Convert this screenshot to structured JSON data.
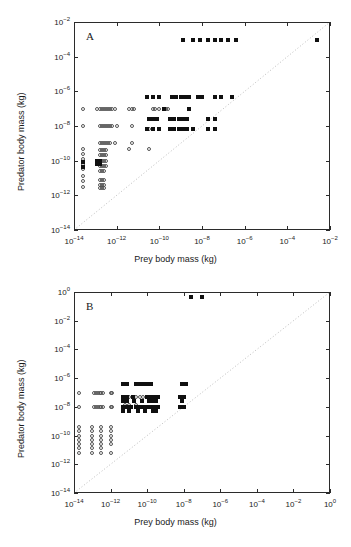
{
  "figure": {
    "axis_titles": {
      "x": "Prey body mass (kg)",
      "y": "Predator body mass (kg)"
    },
    "colors": {
      "axis": "#2b2b2b",
      "marker_filled": "#101010",
      "marker_open": "#555555",
      "reference_line": "#bdbdbd"
    }
  },
  "chart_data": [
    {
      "type": "scatter",
      "panel": "A",
      "title": "A",
      "xlabel": "Prey body mass (kg)",
      "ylabel": "Predator body mass (kg)",
      "xscale": "log",
      "yscale": "log",
      "xlim": [
        1e-14,
        0.01
      ],
      "ylim": [
        1e-14,
        0.01
      ],
      "grid": false,
      "legend": "none",
      "xticks": [
        "10^-14",
        "10^-12",
        "10^-10",
        "10^-8",
        "10^-6",
        "10^-4",
        "10^-2"
      ],
      "yticks": [
        "10^-14",
        "10^-12",
        "10^-10",
        "10^-8",
        "10^-6",
        "10^-4",
        "10^-2"
      ],
      "annotations": [
        {
          "text": "1:1 reference line",
          "type": "dotted_diagonal",
          "from": [
            1e-14,
            1e-14
          ],
          "to": [
            0.01,
            0.01
          ]
        }
      ],
      "series": [
        {
          "name": "open circles",
          "marker": "open-circle",
          "points_log10": [
            [
              -13.6,
              -7.0
            ],
            [
              -13.6,
              -8.0
            ],
            [
              -13.6,
              -9.3
            ],
            [
              -13.6,
              -9.6
            ],
            [
              -13.6,
              -9.9
            ],
            [
              -13.6,
              -10.2
            ],
            [
              -13.6,
              -10.5
            ],
            [
              -13.6,
              -10.9
            ],
            [
              -13.6,
              -11.2
            ],
            [
              -13.6,
              -11.5
            ],
            [
              -12.9,
              -7.0
            ],
            [
              -12.8,
              -7.0
            ],
            [
              -12.7,
              -7.0
            ],
            [
              -12.6,
              -7.0
            ],
            [
              -12.5,
              -7.0
            ],
            [
              -12.4,
              -7.0
            ],
            [
              -12.3,
              -7.0
            ],
            [
              -12.2,
              -7.0
            ],
            [
              -12.1,
              -7.0
            ],
            [
              -12.8,
              -8.0
            ],
            [
              -12.7,
              -8.0
            ],
            [
              -12.6,
              -8.0
            ],
            [
              -12.5,
              -8.0
            ],
            [
              -12.4,
              -8.0
            ],
            [
              -12.3,
              -8.0
            ],
            [
              -12.2,
              -8.0
            ],
            [
              -12.0,
              -8.0
            ],
            [
              -12.8,
              -9.0
            ],
            [
              -12.7,
              -9.0
            ],
            [
              -12.6,
              -9.0
            ],
            [
              -12.5,
              -9.0
            ],
            [
              -12.4,
              -9.0
            ],
            [
              -12.3,
              -9.0
            ],
            [
              -12.1,
              -9.0
            ],
            [
              -12.8,
              -9.4
            ],
            [
              -12.7,
              -9.4
            ],
            [
              -12.6,
              -9.4
            ],
            [
              -12.5,
              -9.4
            ],
            [
              -12.8,
              -9.7
            ],
            [
              -12.7,
              -9.7
            ],
            [
              -12.6,
              -9.7
            ],
            [
              -12.5,
              -9.7
            ],
            [
              -12.8,
              -10.0
            ],
            [
              -12.7,
              -10.0
            ],
            [
              -12.6,
              -10.0
            ],
            [
              -12.5,
              -10.0
            ],
            [
              -12.8,
              -10.3
            ],
            [
              -12.7,
              -10.3
            ],
            [
              -12.6,
              -10.3
            ],
            [
              -12.5,
              -10.3
            ],
            [
              -12.8,
              -10.6
            ],
            [
              -12.7,
              -10.6
            ],
            [
              -12.6,
              -10.6
            ],
            [
              -12.8,
              -11.1
            ],
            [
              -12.7,
              -11.1
            ],
            [
              -12.6,
              -11.1
            ],
            [
              -12.8,
              -11.4
            ],
            [
              -12.7,
              -11.4
            ],
            [
              -12.6,
              -11.4
            ],
            [
              -12.8,
              -11.6
            ],
            [
              -12.7,
              -11.6
            ],
            [
              -12.6,
              -11.6
            ],
            [
              -11.4,
              -7.0
            ],
            [
              -11.3,
              -7.0
            ],
            [
              -11.2,
              -7.0
            ],
            [
              -11.3,
              -8.0
            ],
            [
              -11.3,
              -9.0
            ],
            [
              -11.4,
              -9.3
            ],
            [
              -10.6,
              -6.3
            ],
            [
              -10.3,
              -7.0
            ],
            [
              -10.2,
              -7.0
            ],
            [
              -10.0,
              -7.0
            ],
            [
              -9.7,
              -7.0
            ],
            [
              -9.6,
              -7.0
            ],
            [
              -10.5,
              -8.2
            ],
            [
              -10.5,
              -9.3
            ]
          ]
        },
        {
          "name": "filled squares",
          "marker": "filled-square",
          "points_log10": [
            [
              -8.9,
              -3.05
            ],
            [
              -8.4,
              -3.05
            ],
            [
              -8.1,
              -3.05
            ],
            [
              -7.7,
              -3.05
            ],
            [
              -7.4,
              -3.05
            ],
            [
              -7.1,
              -3.05
            ],
            [
              -6.8,
              -3.05
            ],
            [
              -6.4,
              -3.05
            ],
            [
              -2.6,
              -3.05
            ],
            [
              -10.6,
              -6.3
            ],
            [
              -10.3,
              -6.3
            ],
            [
              -10.0,
              -6.3
            ],
            [
              -9.4,
              -6.3
            ],
            [
              -9.2,
              -6.3
            ],
            [
              -9.0,
              -6.3
            ],
            [
              -8.8,
              -6.3
            ],
            [
              -8.6,
              -6.3
            ],
            [
              -8.2,
              -6.3
            ],
            [
              -8.0,
              -6.3
            ],
            [
              -7.4,
              -6.3
            ],
            [
              -7.1,
              -6.3
            ],
            [
              -6.6,
              -6.3
            ],
            [
              -9.8,
              -7.0
            ],
            [
              -8.6,
              -7.0
            ],
            [
              -10.5,
              -7.6
            ],
            [
              -10.3,
              -7.6
            ],
            [
              -10.1,
              -7.6
            ],
            [
              -9.5,
              -7.6
            ],
            [
              -9.3,
              -7.6
            ],
            [
              -9.1,
              -7.6
            ],
            [
              -8.9,
              -7.6
            ],
            [
              -8.7,
              -7.6
            ],
            [
              -7.7,
              -7.6
            ],
            [
              -7.4,
              -7.6
            ],
            [
              -10.6,
              -8.2
            ],
            [
              -10.3,
              -8.2
            ],
            [
              -10.0,
              -8.2
            ],
            [
              -9.5,
              -8.2
            ],
            [
              -9.3,
              -8.2
            ],
            [
              -9.1,
              -8.2
            ],
            [
              -8.9,
              -8.2
            ],
            [
              -8.7,
              -8.2
            ],
            [
              -8.4,
              -8.2
            ],
            [
              -7.7,
              -8.2
            ],
            [
              -7.4,
              -8.2
            ],
            [
              -12.9,
              -10.0
            ],
            [
              -12.8,
              -10.0
            ],
            [
              -12.9,
              -10.2
            ],
            [
              -12.8,
              -10.2
            ],
            [
              -13.6,
              -10.1
            ],
            [
              -13.6,
              -10.35
            ]
          ]
        }
      ]
    },
    {
      "type": "scatter",
      "panel": "B",
      "title": "B",
      "xlabel": "Prey body mass (kg)",
      "ylabel": "Predator body mass (kg)",
      "xscale": "log",
      "yscale": "log",
      "xlim": [
        1e-14,
        1.0
      ],
      "ylim": [
        1e-14,
        1.0
      ],
      "grid": false,
      "legend": "none",
      "xticks": [
        "10^-14",
        "10^-12",
        "10^-10",
        "10^-8",
        "10^-6",
        "10^-4",
        "10^-2",
        "10^0"
      ],
      "yticks": [
        "10^-14",
        "10^-12",
        "10^-10",
        "10^-8",
        "10^-6",
        "10^-4",
        "10^-2",
        "10^0"
      ],
      "annotations": [
        {
          "text": "1:1 reference line",
          "type": "dotted_diagonal",
          "from": [
            1e-14,
            1e-14
          ],
          "to": [
            1.0,
            1.0
          ]
        }
      ],
      "series": [
        {
          "name": "open circles",
          "marker": "open-circle",
          "points_log10": [
            [
              -13.7,
              -7.0
            ],
            [
              -13.7,
              -8.0
            ],
            [
              -12.9,
              -7.0
            ],
            [
              -12.8,
              -7.0
            ],
            [
              -12.7,
              -7.0
            ],
            [
              -12.6,
              -7.0
            ],
            [
              -12.5,
              -7.0
            ],
            [
              -12.4,
              -7.0
            ],
            [
              -12.9,
              -8.0
            ],
            [
              -12.8,
              -8.0
            ],
            [
              -12.7,
              -8.0
            ],
            [
              -12.6,
              -8.0
            ],
            [
              -12.5,
              -8.0
            ],
            [
              -12.4,
              -8.0
            ],
            [
              -12.0,
              -7.0
            ],
            [
              -11.9,
              -7.0
            ],
            [
              -12.0,
              -8.0
            ],
            [
              -11.9,
              -8.0
            ],
            [
              -13.7,
              -9.4
            ],
            [
              -13.7,
              -9.7
            ],
            [
              -13.7,
              -10.0
            ],
            [
              -13.7,
              -10.3
            ],
            [
              -13.7,
              -10.6
            ],
            [
              -13.7,
              -10.9
            ],
            [
              -13.7,
              -11.2
            ],
            [
              -13.0,
              -9.4
            ],
            [
              -13.0,
              -9.7
            ],
            [
              -13.0,
              -10.0
            ],
            [
              -13.0,
              -10.3
            ],
            [
              -13.0,
              -10.6
            ],
            [
              -13.0,
              -10.9
            ],
            [
              -13.0,
              -11.2
            ],
            [
              -12.5,
              -9.4
            ],
            [
              -12.5,
              -9.7
            ],
            [
              -12.5,
              -10.0
            ],
            [
              -12.5,
              -10.3
            ],
            [
              -12.5,
              -10.6
            ],
            [
              -12.5,
              -10.9
            ],
            [
              -12.5,
              -11.2
            ],
            [
              -12.0,
              -9.4
            ],
            [
              -12.0,
              -9.7
            ],
            [
              -12.0,
              -10.0
            ],
            [
              -12.0,
              -10.3
            ],
            [
              -12.0,
              -10.6
            ],
            [
              -12.0,
              -11.2
            ],
            [
              -11.2,
              -7.3
            ],
            [
              -11.0,
              -7.3
            ],
            [
              -10.6,
              -7.3
            ],
            [
              -10.4,
              -7.3
            ],
            [
              -10.2,
              -7.3
            ],
            [
              -11.2,
              -7.9
            ],
            [
              -11.0,
              -7.9
            ],
            [
              -10.6,
              -7.9
            ]
          ]
        },
        {
          "name": "filled squares",
          "marker": "filled-square",
          "points_log10": [
            [
              -7.6,
              -0.35
            ],
            [
              -7.0,
              -0.35
            ],
            [
              -11.3,
              -6.4
            ],
            [
              -11.1,
              -6.4
            ],
            [
              -10.6,
              -6.4
            ],
            [
              -10.4,
              -6.4
            ],
            [
              -10.2,
              -6.4
            ],
            [
              -10.0,
              -6.4
            ],
            [
              -9.8,
              -6.4
            ],
            [
              -8.1,
              -6.4
            ],
            [
              -7.9,
              -6.4
            ],
            [
              -11.3,
              -7.3
            ],
            [
              -11.1,
              -7.3
            ],
            [
              -10.8,
              -7.3
            ],
            [
              -10.0,
              -7.3
            ],
            [
              -9.8,
              -7.3
            ],
            [
              -9.6,
              -7.3
            ],
            [
              -9.4,
              -7.3
            ],
            [
              -8.2,
              -7.3
            ],
            [
              -8.0,
              -7.3
            ],
            [
              -11.3,
              -7.6
            ],
            [
              -11.1,
              -7.6
            ],
            [
              -10.7,
              -7.6
            ],
            [
              -10.3,
              -7.6
            ],
            [
              -9.9,
              -7.6
            ],
            [
              -9.7,
              -7.6
            ],
            [
              -9.5,
              -7.6
            ],
            [
              -8.1,
              -7.6
            ],
            [
              -11.3,
              -8.0
            ],
            [
              -11.1,
              -8.0
            ],
            [
              -10.9,
              -8.0
            ],
            [
              -10.6,
              -8.0
            ],
            [
              -10.4,
              -8.0
            ],
            [
              -10.2,
              -8.0
            ],
            [
              -10.0,
              -8.0
            ],
            [
              -9.8,
              -8.0
            ],
            [
              -9.6,
              -8.0
            ],
            [
              -9.4,
              -8.0
            ],
            [
              -8.2,
              -8.0
            ],
            [
              -8.0,
              -8.0
            ],
            [
              -11.3,
              -8.3
            ],
            [
              -11.0,
              -8.3
            ],
            [
              -10.5,
              -8.3
            ],
            [
              -10.1,
              -8.3
            ],
            [
              -9.7,
              -8.3
            ],
            [
              -9.5,
              -8.3
            ]
          ]
        }
      ]
    }
  ]
}
